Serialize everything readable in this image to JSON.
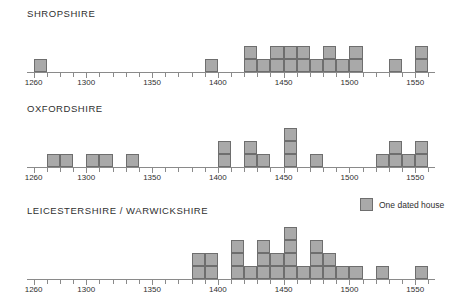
{
  "legend": {
    "label": "One dated house",
    "swatch_color": "#a9a9a9",
    "swatch_border": "#6e6e6e"
  },
  "axis": {
    "min": 1255,
    "max": 1565,
    "tick_step": 10,
    "label_step": 50,
    "labels": [
      "1260",
      "1300",
      "1350",
      "1400",
      "1450",
      "1500",
      "1550"
    ],
    "label_values": [
      1260,
      1300,
      1350,
      1400,
      1450,
      1500,
      1550
    ]
  },
  "chart_data": {
    "type": "bar",
    "xlabel": "",
    "ylabel": "Number of dated houses",
    "xlim": [
      1255,
      1565
    ],
    "grid": false,
    "legend": "One dated house",
    "bin_width": 10,
    "panels": [
      {
        "title": "SHROPSHIRE",
        "categories": [
          1260,
          1270,
          1280,
          1290,
          1300,
          1310,
          1320,
          1330,
          1340,
          1350,
          1360,
          1370,
          1380,
          1390,
          1400,
          1410,
          1420,
          1430,
          1440,
          1450,
          1460,
          1470,
          1480,
          1490,
          1500,
          1510,
          1520,
          1530,
          1540,
          1550,
          1560
        ],
        "values": [
          1,
          0,
          0,
          0,
          0,
          0,
          0,
          0,
          0,
          0,
          0,
          0,
          0,
          1,
          0,
          0,
          2,
          1,
          2,
          2,
          2,
          1,
          2,
          1,
          2,
          0,
          0,
          1,
          0,
          2,
          0
        ]
      },
      {
        "title": "OXFORDSHIRE",
        "categories": [
          1260,
          1270,
          1280,
          1290,
          1300,
          1310,
          1320,
          1330,
          1340,
          1350,
          1360,
          1370,
          1380,
          1390,
          1400,
          1410,
          1420,
          1430,
          1440,
          1450,
          1460,
          1470,
          1480,
          1490,
          1500,
          1510,
          1520,
          1530,
          1540,
          1550,
          1560
        ],
        "values": [
          0,
          1,
          1,
          0,
          1,
          1,
          0,
          1,
          0,
          0,
          0,
          0,
          0,
          0,
          2,
          0,
          2,
          1,
          0,
          3,
          0,
          1,
          0,
          0,
          0,
          0,
          1,
          2,
          1,
          2,
          0
        ]
      },
      {
        "title": "LEICESTERSHIRE / WARWICKSHIRE",
        "categories": [
          1260,
          1270,
          1280,
          1290,
          1300,
          1310,
          1320,
          1330,
          1340,
          1350,
          1360,
          1370,
          1380,
          1390,
          1400,
          1410,
          1420,
          1430,
          1440,
          1450,
          1460,
          1470,
          1480,
          1490,
          1500,
          1510,
          1520,
          1530,
          1540,
          1550,
          1560
        ],
        "values": [
          0,
          0,
          0,
          0,
          0,
          0,
          0,
          0,
          0,
          0,
          0,
          0,
          2,
          2,
          0,
          3,
          1,
          3,
          2,
          4,
          1,
          3,
          2,
          1,
          1,
          0,
          1,
          0,
          0,
          1,
          0
        ]
      }
    ]
  }
}
